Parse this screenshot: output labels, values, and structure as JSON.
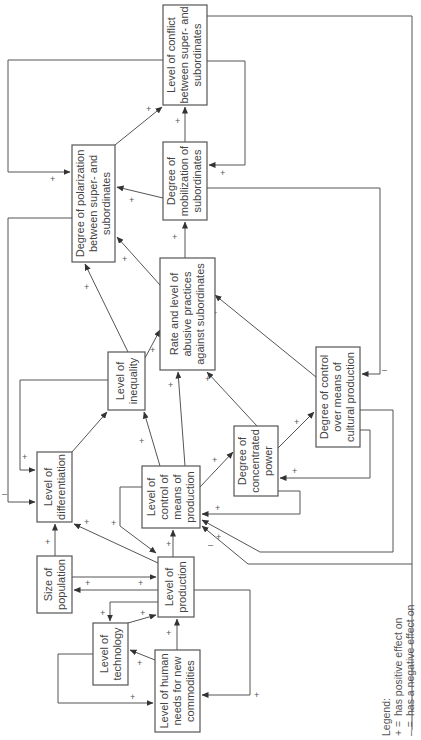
{
  "diagram": {
    "type": "causal-loop",
    "orientation": "rotated-90-ccw",
    "nodes": {
      "conflict": {
        "lines": [
          "Level of conflict",
          "between super- and",
          "subordinates"
        ]
      },
      "polarization": {
        "lines": [
          "Degree of polarization",
          "between super- and",
          "subordinates"
        ]
      },
      "mobilization": {
        "lines": [
          "Degree of",
          "mobilization of",
          "subordinates"
        ]
      },
      "abusive": {
        "lines": [
          "Rate and level of",
          "abusive practices",
          "against subordinates"
        ]
      },
      "inequality": {
        "lines": [
          "Level of",
          "inequality"
        ]
      },
      "differentiation": {
        "lines": [
          "Level of",
          "differentiation"
        ]
      },
      "control_production": {
        "lines": [
          "Level of",
          "control of",
          "means of",
          "production"
        ]
      },
      "concentrated_power": {
        "lines": [
          "Degree of",
          "concentrated",
          "power"
        ]
      },
      "cultural_production": {
        "lines": [
          "Degree of control",
          "over means of",
          "cultural production"
        ]
      },
      "population": {
        "lines": [
          "Size of",
          "population"
        ]
      },
      "production": {
        "lines": [
          "Level of",
          "production"
        ]
      },
      "technology": {
        "lines": [
          "Level of",
          "technology"
        ]
      },
      "human_needs": {
        "lines": [
          "Level of human",
          "needs for new",
          "commodities"
        ]
      }
    },
    "signs": {
      "pos": "+",
      "neg": "–"
    },
    "edges": [
      {
        "from": "polarization",
        "to": "conflict",
        "sign": "+"
      },
      {
        "from": "mobilization",
        "to": "conflict",
        "sign": "+"
      },
      {
        "from": "conflict",
        "to": "polarization",
        "sign": "+"
      },
      {
        "from": "conflict",
        "to": "mobilization",
        "sign": "+"
      },
      {
        "from": "conflict",
        "to": "cultural_production",
        "sign": "–"
      },
      {
        "from": "mobilization",
        "to": "polarization",
        "sign": "+"
      },
      {
        "from": "abusive",
        "to": "polarization",
        "sign": "+"
      },
      {
        "from": "abusive",
        "to": "mobilization",
        "sign": "+"
      },
      {
        "from": "inequality",
        "to": "polarization",
        "sign": "+"
      },
      {
        "from": "inequality",
        "to": "abusive",
        "sign": "+"
      },
      {
        "from": "inequality",
        "to": "differentiation",
        "sign": "+"
      },
      {
        "from": "polarization",
        "to": "differentiation",
        "sign": "–"
      },
      {
        "from": "differentiation",
        "to": "inequality",
        "sign": "+"
      },
      {
        "from": "control_production",
        "to": "inequality",
        "sign": "+"
      },
      {
        "from": "control_production",
        "to": "abusive",
        "sign": "+"
      },
      {
        "from": "control_production",
        "to": "concentrated_power",
        "sign": "+"
      },
      {
        "from": "control_production",
        "to": "production",
        "sign": "+"
      },
      {
        "from": "concentrated_power",
        "to": "abusive",
        "sign": "+"
      },
      {
        "from": "concentrated_power",
        "to": "cultural_production",
        "sign": "+"
      },
      {
        "from": "concentrated_power",
        "to": "control_production",
        "sign": "+"
      },
      {
        "from": "cultural_production",
        "to": "abusive",
        "sign": "+"
      },
      {
        "from": "cultural_production",
        "to": "concentrated_power",
        "sign": "+"
      },
      {
        "from": "cultural_production",
        "to": "control_production",
        "sign": "+"
      },
      {
        "from": "mobilization",
        "to": "control_production",
        "sign": "–"
      },
      {
        "from": "population",
        "to": "differentiation",
        "sign": "+"
      },
      {
        "from": "population",
        "to": "production",
        "sign": "+"
      },
      {
        "from": "production",
        "to": "population",
        "sign": "+"
      },
      {
        "from": "production",
        "to": "differentiation",
        "sign": "+"
      },
      {
        "from": "production",
        "to": "control_production",
        "sign": "+"
      },
      {
        "from": "production",
        "to": "technology",
        "sign": "+"
      },
      {
        "from": "production",
        "to": "human_needs",
        "sign": "+"
      },
      {
        "from": "technology",
        "to": "production",
        "sign": "+"
      },
      {
        "from": "technology",
        "to": "human_needs",
        "sign": "+"
      },
      {
        "from": "human_needs",
        "to": "technology",
        "sign": "+"
      },
      {
        "from": "human_needs",
        "to": "production",
        "sign": "+"
      }
    ],
    "legend": {
      "title": "Legend:",
      "items": [
        {
          "symbol": "+ =",
          "text": "has positive effect on"
        },
        {
          "symbol": "– =",
          "text": "has a negative effect on"
        }
      ]
    }
  }
}
